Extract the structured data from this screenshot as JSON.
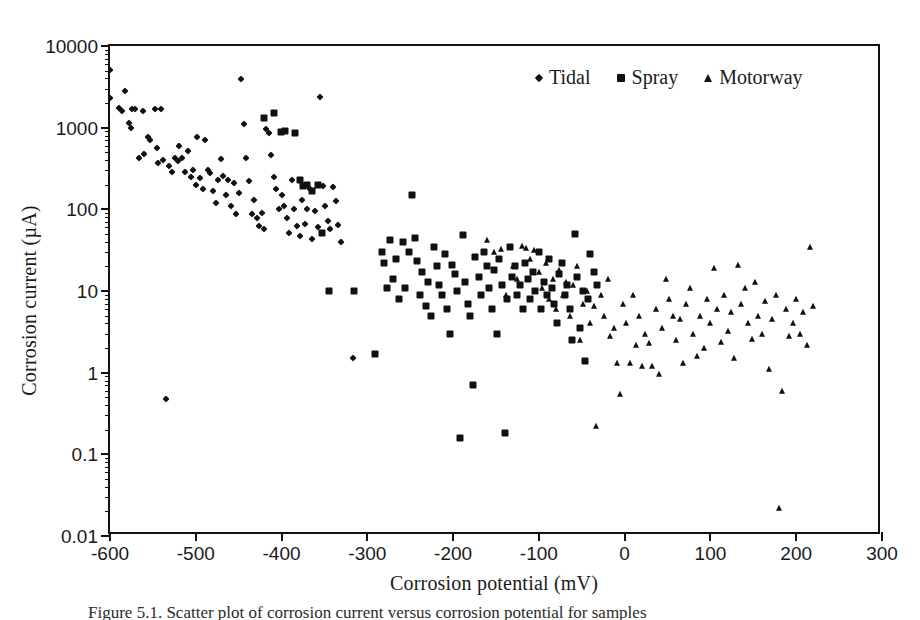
{
  "figure": {
    "caption": "Figure 5.1. Scatter plot of corrosion current versus corrosion potential for samples"
  },
  "chart_data": {
    "type": "scatter",
    "title": "",
    "xlabel": "Corrosion potential (mV)",
    "ylabel": "Corrosion current (µA)",
    "xlim": [
      -600,
      300
    ],
    "ylim": [
      0.01,
      10000
    ],
    "xscale": "linear",
    "yscale": "log",
    "grid": false,
    "legend_position": "top-right",
    "xticks": [
      -600,
      -500,
      -400,
      -300,
      -200,
      -100,
      0,
      100,
      200,
      300
    ],
    "xtick_labels": [
      "-600",
      "-500",
      "-400",
      "-300",
      "-200",
      "-100",
      "0",
      "100",
      "200",
      "300"
    ],
    "yticks": [
      0.01,
      0.1,
      1,
      10,
      100,
      1000,
      10000
    ],
    "ytick_labels": [
      "0.01",
      "0.1",
      "1",
      "10",
      "100",
      "1000",
      "10000"
    ],
    "series": [
      {
        "name": "Tidal",
        "marker": "diamond",
        "color": "#111111",
        "points": [
          [
            -600,
            5100
          ],
          [
            -600,
            2300
          ],
          [
            -589,
            1750
          ],
          [
            -586,
            1600
          ],
          [
            -583,
            2800
          ],
          [
            -578,
            1150
          ],
          [
            -576,
            980
          ],
          [
            -574,
            1680
          ],
          [
            -571,
            1700
          ],
          [
            -566,
            420
          ],
          [
            -562,
            1600
          ],
          [
            -560,
            480
          ],
          [
            -556,
            760
          ],
          [
            -553,
            700
          ],
          [
            -548,
            1700
          ],
          [
            -545,
            560
          ],
          [
            -544,
            365
          ],
          [
            -540,
            1680
          ],
          [
            -538,
            400
          ],
          [
            -535,
            0.47
          ],
          [
            -531,
            340
          ],
          [
            -528,
            290
          ],
          [
            -524,
            430
          ],
          [
            -521,
            395
          ],
          [
            -519,
            600
          ],
          [
            -516,
            430
          ],
          [
            -513,
            285
          ],
          [
            -509,
            520
          ],
          [
            -506,
            250
          ],
          [
            -503,
            300
          ],
          [
            -500,
            200
          ],
          [
            -498,
            760
          ],
          [
            -495,
            240
          ],
          [
            -492,
            175
          ],
          [
            -489,
            700
          ],
          [
            -486,
            300
          ],
          [
            -483,
            280
          ],
          [
            -480,
            170
          ],
          [
            -477,
            120
          ],
          [
            -474,
            230
          ],
          [
            -471,
            410
          ],
          [
            -468,
            255
          ],
          [
            -465,
            150
          ],
          [
            -462,
            230
          ],
          [
            -459,
            110
          ],
          [
            -456,
            210
          ],
          [
            -453,
            88
          ],
          [
            -450,
            160
          ],
          [
            -447,
            3900
          ],
          [
            -444,
            1100
          ],
          [
            -441,
            420
          ],
          [
            -438,
            225
          ],
          [
            -435,
            88
          ],
          [
            -432,
            130
          ],
          [
            -429,
            78
          ],
          [
            -426,
            62
          ],
          [
            -423,
            90
          ],
          [
            -421,
            58
          ],
          [
            -418,
            950
          ],
          [
            -415,
            850
          ],
          [
            -412,
            460
          ],
          [
            -409,
            250
          ],
          [
            -406,
            175
          ],
          [
            -403,
            100
          ],
          [
            -400,
            150
          ],
          [
            -397,
            110
          ],
          [
            -394,
            78
          ],
          [
            -391,
            52
          ],
          [
            -388,
            230
          ],
          [
            -385,
            100
          ],
          [
            -382,
            62
          ],
          [
            -379,
            47
          ],
          [
            -376,
            130
          ],
          [
            -373,
            66
          ],
          [
            -370,
            100
          ],
          [
            -367,
            175
          ],
          [
            -364,
            43
          ],
          [
            -361,
            95
          ],
          [
            -358,
            60
          ],
          [
            -355,
            2400
          ],
          [
            -352,
            195
          ],
          [
            -349,
            110
          ],
          [
            -346,
            72
          ],
          [
            -343,
            58
          ],
          [
            -340,
            190
          ],
          [
            -337,
            125
          ],
          [
            -334,
            64
          ],
          [
            -331,
            40
          ],
          [
            -317,
            1.5
          ]
        ]
      },
      {
        "name": "Spray",
        "marker": "square",
        "color": "#111111",
        "points": [
          [
            -420,
            1300
          ],
          [
            -409,
            1500
          ],
          [
            -401,
            880
          ],
          [
            -396,
            900
          ],
          [
            -384,
            850
          ],
          [
            -379,
            230
          ],
          [
            -375,
            195
          ],
          [
            -370,
            200
          ],
          [
            -364,
            170
          ],
          [
            -358,
            200
          ],
          [
            -353,
            52
          ],
          [
            -345,
            10
          ],
          [
            -316,
            10
          ],
          [
            -291,
            1.7
          ],
          [
            -283,
            30
          ],
          [
            -280,
            22
          ],
          [
            -277,
            11
          ],
          [
            -273,
            42
          ],
          [
            -270,
            14
          ],
          [
            -267,
            25
          ],
          [
            -263,
            8
          ],
          [
            -259,
            40
          ],
          [
            -256,
            11
          ],
          [
            -252,
            30
          ],
          [
            -248,
            150
          ],
          [
            -245,
            45
          ],
          [
            -242,
            23
          ],
          [
            -239,
            9
          ],
          [
            -236,
            17
          ],
          [
            -232,
            6.5
          ],
          [
            -229,
            13
          ],
          [
            -226,
            5
          ],
          [
            -222,
            35
          ],
          [
            -219,
            20
          ],
          [
            -216,
            12
          ],
          [
            -213,
            9
          ],
          [
            -210,
            28
          ],
          [
            -207,
            6
          ],
          [
            -204,
            3
          ],
          [
            -201,
            21
          ],
          [
            -198,
            16
          ],
          [
            -195,
            10
          ],
          [
            -192,
            0.16
          ],
          [
            -189,
            48
          ],
          [
            -186,
            13
          ],
          [
            -183,
            7
          ],
          [
            -180,
            5
          ],
          [
            -177,
            0.7
          ],
          [
            -174,
            26
          ],
          [
            -170,
            15
          ],
          [
            -167,
            9
          ],
          [
            -164,
            30
          ],
          [
            -161,
            20
          ],
          [
            -158,
            11
          ],
          [
            -155,
            6
          ],
          [
            -152,
            18
          ],
          [
            -149,
            3
          ],
          [
            -146,
            25
          ],
          [
            -143,
            12
          ],
          [
            -140,
            0.18
          ],
          [
            -137,
            8
          ],
          [
            -134,
            35
          ],
          [
            -131,
            15
          ],
          [
            -128,
            20
          ],
          [
            -125,
            9
          ],
          [
            -122,
            12
          ],
          [
            -119,
            6
          ],
          [
            -116,
            22
          ],
          [
            -113,
            14
          ],
          [
            -110,
            8
          ],
          [
            -107,
            17
          ],
          [
            -104,
            10
          ],
          [
            -100,
            30
          ],
          [
            -97,
            6
          ],
          [
            -94,
            13
          ],
          [
            -91,
            9
          ],
          [
            -88,
            25
          ],
          [
            -85,
            11
          ],
          [
            -82,
            7
          ],
          [
            -79,
            4
          ],
          [
            -76,
            16
          ],
          [
            -73,
            22
          ],
          [
            -70,
            9
          ],
          [
            -67,
            12
          ],
          [
            -64,
            6
          ],
          [
            -61,
            2.5
          ],
          [
            -58,
            50
          ],
          [
            -55,
            15
          ],
          [
            -52,
            3.5
          ],
          [
            -49,
            10
          ],
          [
            -46,
            1.4
          ],
          [
            -43,
            8
          ],
          [
            -40,
            28
          ],
          [
            -36,
            17
          ],
          [
            -32,
            12
          ]
        ]
      },
      {
        "name": "Motorway",
        "marker": "triangle",
        "color": "#111111",
        "points": [
          [
            -160,
            42
          ],
          [
            -152,
            30
          ],
          [
            -144,
            33
          ],
          [
            -138,
            9
          ],
          [
            -130,
            20
          ],
          [
            -126,
            14
          ],
          [
            -120,
            36
          ],
          [
            -115,
            34
          ],
          [
            -110,
            25
          ],
          [
            -106,
            32
          ],
          [
            -100,
            17
          ],
          [
            -96,
            11
          ],
          [
            -92,
            22
          ],
          [
            -88,
            8
          ],
          [
            -84,
            14
          ],
          [
            -80,
            6
          ],
          [
            -76,
            18
          ],
          [
            -72,
            9
          ],
          [
            -68,
            13
          ],
          [
            -64,
            5
          ],
          [
            -60,
            12
          ],
          [
            -56,
            20
          ],
          [
            -52,
            2.5
          ],
          [
            -48,
            7
          ],
          [
            -44,
            10
          ],
          [
            -40,
            4
          ],
          [
            -36,
            6.5
          ],
          [
            -33,
            0.22
          ],
          [
            -28,
            9
          ],
          [
            -24,
            5
          ],
          [
            -20,
            14
          ],
          [
            -17,
            2.8
          ],
          [
            -13,
            3.5
          ],
          [
            -9,
            1.3
          ],
          [
            -5,
            0.55
          ],
          [
            -2,
            7
          ],
          [
            2,
            4
          ],
          [
            6,
            1.3
          ],
          [
            10,
            9
          ],
          [
            13,
            2.2
          ],
          [
            17,
            5
          ],
          [
            20,
            1.2
          ],
          [
            24,
            3
          ],
          [
            28,
            2.3
          ],
          [
            32,
            1.2
          ],
          [
            36,
            6
          ],
          [
            40,
            0.95
          ],
          [
            44,
            3.5
          ],
          [
            48,
            14
          ],
          [
            52,
            8
          ],
          [
            56,
            5
          ],
          [
            60,
            2.5
          ],
          [
            64,
            4.5
          ],
          [
            68,
            1.3
          ],
          [
            72,
            7
          ],
          [
            76,
            11
          ],
          [
            80,
            3
          ],
          [
            84,
            1.6
          ],
          [
            88,
            5
          ],
          [
            92,
            2
          ],
          [
            96,
            8
          ],
          [
            100,
            4
          ],
          [
            104,
            19
          ],
          [
            108,
            6
          ],
          [
            112,
            2.4
          ],
          [
            116,
            9
          ],
          [
            120,
            3.2
          ],
          [
            124,
            5.5
          ],
          [
            128,
            1.5
          ],
          [
            132,
            21
          ],
          [
            136,
            7
          ],
          [
            140,
            11
          ],
          [
            144,
            4
          ],
          [
            148,
            2.6
          ],
          [
            152,
            13
          ],
          [
            156,
            5
          ],
          [
            160,
            3
          ],
          [
            164,
            7.5
          ],
          [
            168,
            1.1
          ],
          [
            172,
            4.5
          ],
          [
            176,
            9
          ],
          [
            180,
            0.022
          ],
          [
            184,
            0.6
          ],
          [
            188,
            6
          ],
          [
            192,
            2.8
          ],
          [
            196,
            4
          ],
          [
            200,
            8
          ],
          [
            204,
            3
          ],
          [
            208,
            5.5
          ],
          [
            212,
            2.2
          ],
          [
            216,
            35
          ],
          [
            220,
            6.5
          ]
        ]
      }
    ]
  },
  "axes": {
    "x_title": "Corrosion potential (mV)",
    "y_title": "Corrosion current (µA)"
  },
  "legend": {
    "entries": [
      {
        "label": "Tidal",
        "marker": "diamond"
      },
      {
        "label": "Spray",
        "marker": "square"
      },
      {
        "label": "Motorway",
        "marker": "triangle"
      }
    ]
  }
}
